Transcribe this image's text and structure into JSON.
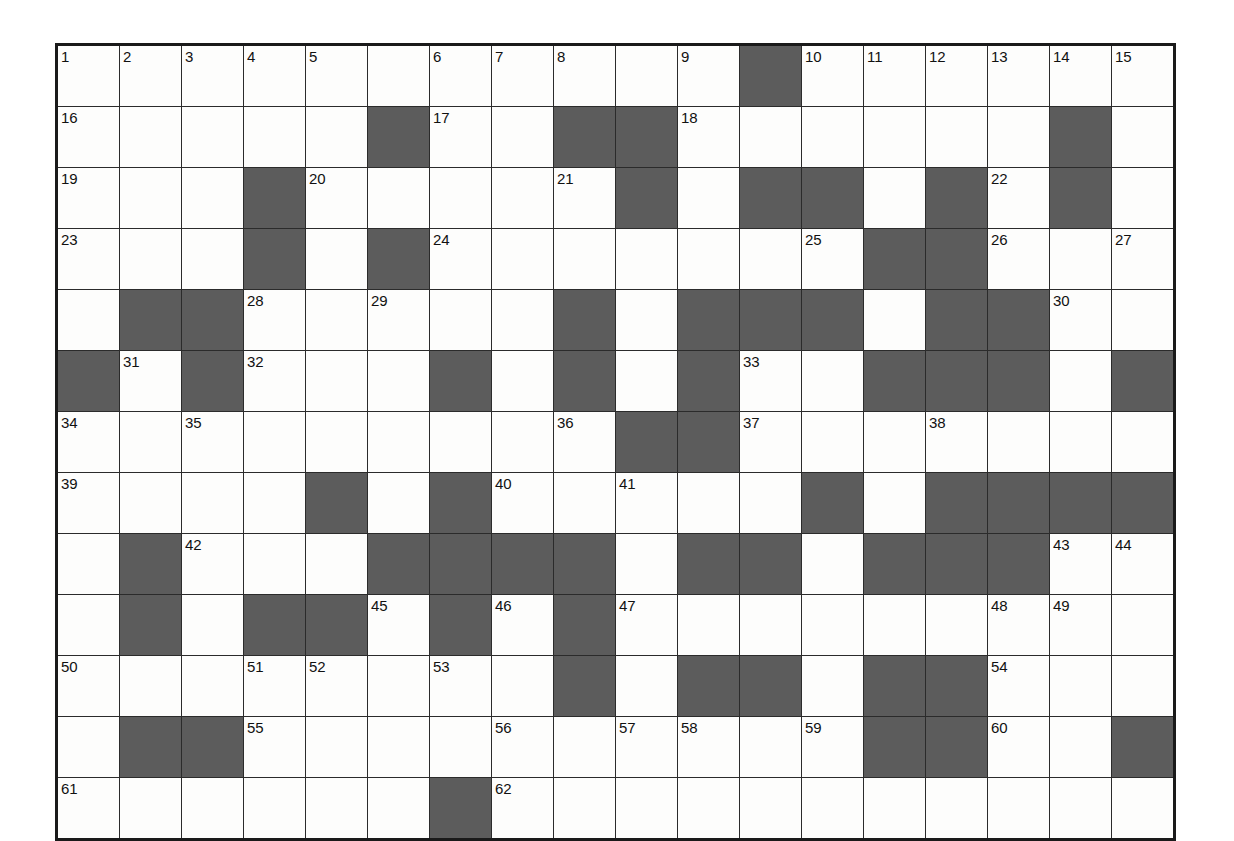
{
  "puzzle": {
    "type": "crossword-grid",
    "rows": 13,
    "cols": 18,
    "colors": {
      "block": "#5c5c5c",
      "cell": "#fdfdfc",
      "grid_line": "#2b2b2b",
      "border": "#1a1a1a",
      "number_text": "#111111"
    },
    "grid": [
      [
        {
          "n": "1"
        },
        {
          "n": "2"
        },
        {
          "n": "3"
        },
        {
          "n": "4"
        },
        {
          "n": "5"
        },
        {
          "n": ""
        },
        {
          "n": "6"
        },
        {
          "n": "7"
        },
        {
          "n": "8"
        },
        {
          "n": ""
        },
        {
          "n": "9"
        },
        {
          "block": true
        },
        {
          "n": "10"
        },
        {
          "n": "11"
        },
        {
          "n": "12"
        },
        {
          "n": "13"
        },
        {
          "n": "14"
        },
        {
          "n": "15"
        }
      ],
      [
        {
          "n": "16"
        },
        {
          "n": ""
        },
        {
          "n": ""
        },
        {
          "n": ""
        },
        {
          "n": ""
        },
        {
          "block": true
        },
        {
          "n": "17"
        },
        {
          "n": ""
        },
        {
          "block": true
        },
        {
          "block": true
        },
        {
          "n": "18"
        },
        {
          "n": ""
        },
        {
          "n": ""
        },
        {
          "n": ""
        },
        {
          "n": ""
        },
        {
          "n": ""
        },
        {
          "block": true
        },
        {
          "n": ""
        }
      ],
      [
        {
          "n": "19"
        },
        {
          "n": ""
        },
        {
          "n": ""
        },
        {
          "block": true
        },
        {
          "n": "20"
        },
        {
          "n": ""
        },
        {
          "n": ""
        },
        {
          "n": ""
        },
        {
          "n": "21"
        },
        {
          "block": true
        },
        {
          "n": ""
        },
        {
          "block": true
        },
        {
          "block": true
        },
        {
          "n": ""
        },
        {
          "block": true
        },
        {
          "n": "22"
        },
        {
          "block": true
        },
        {
          "n": ""
        }
      ],
      [
        {
          "n": "23"
        },
        {
          "n": ""
        },
        {
          "n": ""
        },
        {
          "block": true
        },
        {
          "n": ""
        },
        {
          "block": true
        },
        {
          "n": "24"
        },
        {
          "n": ""
        },
        {
          "n": ""
        },
        {
          "n": ""
        },
        {
          "n": ""
        },
        {
          "n": ""
        },
        {
          "n": "25"
        },
        {
          "block": true
        },
        {
          "block": true
        },
        {
          "n": "26"
        },
        {
          "n": ""
        },
        {
          "n": "27"
        }
      ],
      [
        {
          "n": ""
        },
        {
          "block": true
        },
        {
          "block": true
        },
        {
          "n": "28"
        },
        {
          "n": ""
        },
        {
          "n": "29"
        },
        {
          "n": ""
        },
        {
          "n": ""
        },
        {
          "block": true
        },
        {
          "n": ""
        },
        {
          "block": true
        },
        {
          "block": true
        },
        {
          "block": true
        },
        {
          "n": ""
        },
        {
          "block": true
        },
        {
          "block": true
        },
        {
          "n": "30"
        },
        {
          "n": ""
        }
      ],
      [
        {
          "block": true
        },
        {
          "n": "31"
        },
        {
          "block": true
        },
        {
          "n": "32"
        },
        {
          "n": ""
        },
        {
          "n": ""
        },
        {
          "block": true
        },
        {
          "n": ""
        },
        {
          "block": true
        },
        {
          "n": ""
        },
        {
          "block": true
        },
        {
          "n": "33"
        },
        {
          "n": ""
        },
        {
          "block": true
        },
        {
          "block": true
        },
        {
          "block": true
        },
        {
          "n": ""
        },
        {
          "block": true
        }
      ],
      [
        {
          "n": "34"
        },
        {
          "n": ""
        },
        {
          "n": "35"
        },
        {
          "n": ""
        },
        {
          "n": ""
        },
        {
          "n": ""
        },
        {
          "n": ""
        },
        {
          "n": ""
        },
        {
          "n": "36"
        },
        {
          "block": true
        },
        {
          "block": true
        },
        {
          "n": "37"
        },
        {
          "n": ""
        },
        {
          "n": ""
        },
        {
          "n": "38"
        },
        {
          "n": ""
        },
        {
          "n": ""
        },
        {
          "n": ""
        }
      ],
      [
        {
          "n": "39"
        },
        {
          "n": ""
        },
        {
          "n": ""
        },
        {
          "n": ""
        },
        {
          "block": true
        },
        {
          "n": ""
        },
        {
          "block": true
        },
        {
          "n": "40"
        },
        {
          "n": ""
        },
        {
          "n": "41"
        },
        {
          "n": ""
        },
        {
          "n": ""
        },
        {
          "block": true
        },
        {
          "n": ""
        },
        {
          "block": true
        },
        {
          "block": true
        },
        {
          "block": true
        },
        {
          "block": true
        }
      ],
      [
        {
          "n": ""
        },
        {
          "block": true
        },
        {
          "n": "42"
        },
        {
          "n": ""
        },
        {
          "n": ""
        },
        {
          "block": true
        },
        {
          "block": true
        },
        {
          "block": true
        },
        {
          "block": true
        },
        {
          "n": ""
        },
        {
          "block": true
        },
        {
          "block": true
        },
        {
          "n": ""
        },
        {
          "block": true
        },
        {
          "block": true
        },
        {
          "block": true
        },
        {
          "n": "43"
        },
        {
          "n": "44"
        }
      ],
      [
        {
          "n": ""
        },
        {
          "block": true
        },
        {
          "n": ""
        },
        {
          "block": true
        },
        {
          "block": true
        },
        {
          "n": "45"
        },
        {
          "block": true
        },
        {
          "n": "46"
        },
        {
          "block": true
        },
        {
          "n": "47"
        },
        {
          "n": ""
        },
        {
          "n": ""
        },
        {
          "n": ""
        },
        {
          "n": ""
        },
        {
          "n": ""
        },
        {
          "n": "48"
        },
        {
          "n": "49"
        },
        {
          "n": ""
        }
      ],
      [
        {
          "n": "50"
        },
        {
          "n": ""
        },
        {
          "n": ""
        },
        {
          "n": "51"
        },
        {
          "n": "52"
        },
        {
          "n": ""
        },
        {
          "n": "53"
        },
        {
          "n": ""
        },
        {
          "block": true
        },
        {
          "n": ""
        },
        {
          "block": true
        },
        {
          "block": true
        },
        {
          "n": ""
        },
        {
          "block": true
        },
        {
          "block": true
        },
        {
          "n": "54"
        },
        {
          "n": ""
        },
        {
          "n": ""
        }
      ],
      [
        {
          "n": ""
        },
        {
          "block": true
        },
        {
          "block": true
        },
        {
          "n": "55"
        },
        {
          "n": ""
        },
        {
          "n": ""
        },
        {
          "n": ""
        },
        {
          "n": "56"
        },
        {
          "n": ""
        },
        {
          "n": "57"
        },
        {
          "n": "58"
        },
        {
          "n": ""
        },
        {
          "n": "59"
        },
        {
          "block": true
        },
        {
          "block": true
        },
        {
          "n": "60"
        },
        {
          "n": ""
        },
        {
          "block": true
        }
      ],
      [
        {
          "n": "61"
        },
        {
          "n": ""
        },
        {
          "n": ""
        },
        {
          "n": ""
        },
        {
          "n": ""
        },
        {
          "n": ""
        },
        {
          "block": true
        },
        {
          "n": "62"
        },
        {
          "n": ""
        },
        {
          "n": ""
        },
        {
          "n": ""
        },
        {
          "n": ""
        },
        {
          "n": ""
        },
        {
          "n": ""
        },
        {
          "n": ""
        },
        {
          "n": ""
        },
        {
          "n": ""
        },
        {
          "n": ""
        }
      ]
    ]
  }
}
